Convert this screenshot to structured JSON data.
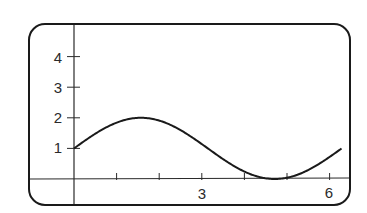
{
  "chart_data": {
    "type": "line",
    "title": "",
    "xlabel": "",
    "ylabel": "",
    "function": "y = sin(x) + 1",
    "xlim": [
      -0.07,
      6.4
    ],
    "ylim": [
      -0.9,
      4.9
    ],
    "grid": false,
    "legend": null,
    "x_ticks": [
      1,
      2,
      3,
      4,
      5,
      6
    ],
    "x_tick_labels": [
      {
        "value": 3,
        "label": "3"
      },
      {
        "value": 6,
        "label": "6"
      }
    ],
    "y_ticks": [
      1,
      2,
      3,
      4
    ],
    "y_tick_labels": [
      {
        "value": 1,
        "label": "1"
      },
      {
        "value": 2,
        "label": "2"
      },
      {
        "value": 3,
        "label": "3"
      },
      {
        "value": 4,
        "label": "4"
      }
    ],
    "series": [
      {
        "name": "sin(x)+1",
        "x": [
          0,
          0.5,
          1,
          1.5708,
          2,
          2.5,
          3,
          3.5,
          4,
          4.5,
          4.7124,
          5,
          5.5,
          6,
          6.28
        ],
        "y": [
          1,
          1.479,
          1.841,
          2,
          1.909,
          1.598,
          1.141,
          0.649,
          0.243,
          0.022,
          0,
          0.041,
          0.295,
          0.721,
          1.0
        ]
      }
    ]
  },
  "labels": {
    "x3": "3",
    "x6": "6",
    "y1": "1",
    "y2": "2",
    "y3": "3",
    "y4": "4"
  }
}
